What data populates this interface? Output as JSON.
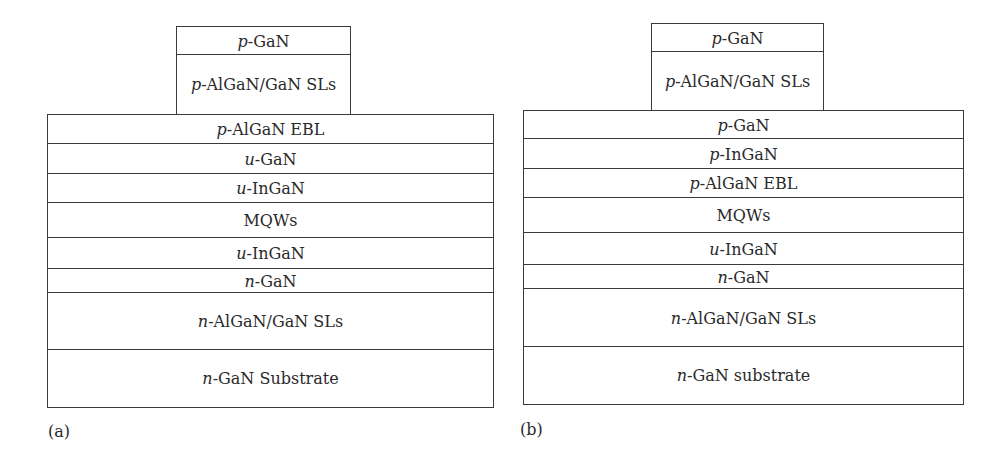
{
  "figure": {
    "panels": [
      {
        "label": "(a)",
        "mesa_layers": [
          {
            "prefix": "p",
            "name": "-GaN"
          },
          {
            "prefix": "p",
            "name": "-AlGaN/GaN SLs"
          }
        ],
        "layers": [
          {
            "prefix": "p",
            "name": "-AlGaN EBL"
          },
          {
            "prefix": "u",
            "name": "-GaN"
          },
          {
            "prefix": "u",
            "name": "-InGaN"
          },
          {
            "prefix": "",
            "name": "MQWs"
          },
          {
            "prefix": "u",
            "name": "-InGaN"
          },
          {
            "prefix": "n",
            "name": "-GaN"
          },
          {
            "prefix": "n",
            "name": "-AlGaN/GaN SLs"
          },
          {
            "prefix": "n",
            "name": "-GaN Substrate"
          }
        ]
      },
      {
        "label": "(b)",
        "mesa_layers": [
          {
            "prefix": "p",
            "name": "-GaN"
          },
          {
            "prefix": "p",
            "name": "-AlGaN/GaN SLs"
          }
        ],
        "layers": [
          {
            "prefix": "p",
            "name": "-GaN"
          },
          {
            "prefix": "p",
            "name": "-InGaN"
          },
          {
            "prefix": "p",
            "name": "-AlGaN EBL"
          },
          {
            "prefix": "",
            "name": "MQWs"
          },
          {
            "prefix": "u",
            "name": "-InGaN"
          },
          {
            "prefix": "n",
            "name": "-GaN"
          },
          {
            "prefix": "n",
            "name": "-AlGaN/GaN SLs"
          },
          {
            "prefix": "n",
            "name": "-GaN substrate"
          }
        ]
      }
    ]
  }
}
